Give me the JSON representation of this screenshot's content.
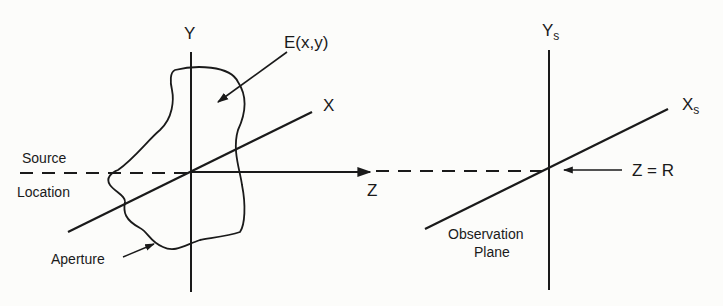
{
  "diagram": {
    "type": "aperture-diffraction-geometry",
    "colors": {
      "ink": "#1a1a1a",
      "background": "#fcfcfa"
    },
    "aperture_plane": {
      "axis_y_label": "Y",
      "axis_x_label": "X",
      "axis_z_label": "Z",
      "field_label": "E(x,y)",
      "aperture_label": "Aperture",
      "source_label_line1": "Source",
      "source_label_line2": "Location"
    },
    "observation_plane": {
      "axis_y_label": "Y",
      "axis_y_subscript": "s",
      "axis_x_label": "X",
      "axis_x_subscript": "s",
      "distance_label": "Z = R",
      "plane_label_line1": "Observation",
      "plane_label_line2": "Plane"
    }
  }
}
